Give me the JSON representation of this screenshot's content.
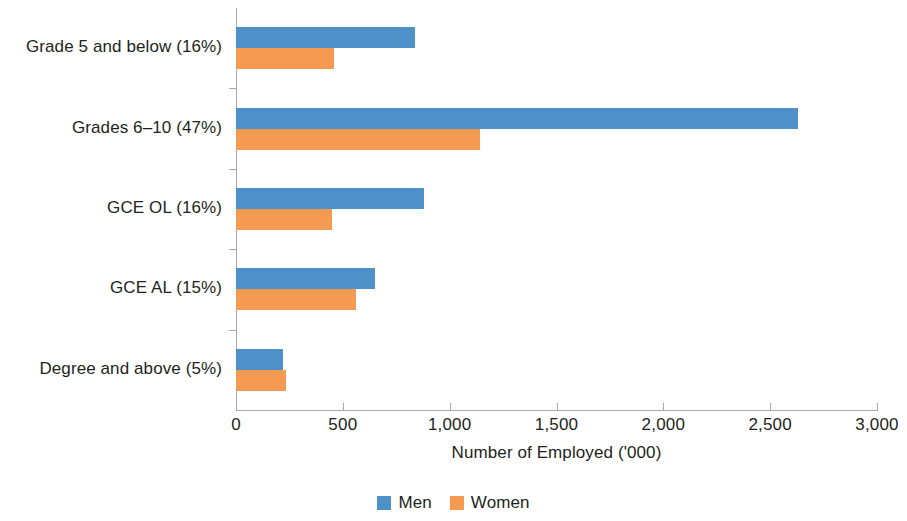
{
  "chart_data": {
    "type": "bar",
    "orientation": "horizontal",
    "title": "",
    "xlabel": "Number of Employed ('000)",
    "ylabel": "",
    "categories": [
      "Grade 5 and below (16%)",
      "Grades 6–10 (47%)",
      "GCE OL (16%)",
      "GCE AL (15%)",
      "Degree and above (5%)"
    ],
    "series": [
      {
        "name": "Men",
        "color": "#4e90c8",
        "values": [
          840,
          2630,
          880,
          650,
          220
        ]
      },
      {
        "name": "Women",
        "color": "#f59a52",
        "values": [
          460,
          1140,
          450,
          560,
          235
        ]
      }
    ],
    "xlim": [
      0,
      3000
    ],
    "xticks": [
      0,
      500,
      1000,
      1500,
      2000,
      2500,
      3000
    ],
    "xtick_labels": [
      "0",
      "500",
      "1,000",
      "1,500",
      "2,000",
      "2,500",
      "3,000"
    ],
    "grid": false,
    "legend_position": "bottom",
    "legend_entries": [
      "Men",
      "Women"
    ]
  },
  "axis": {
    "x_title": "Number of Employed ('000)"
  },
  "legend": {
    "items": [
      {
        "label": "Men",
        "color": "#4e90c8"
      },
      {
        "label": "Women",
        "color": "#f59a52"
      }
    ]
  }
}
